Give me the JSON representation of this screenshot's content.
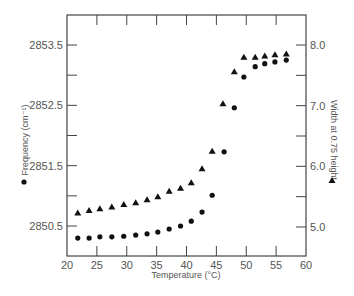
{
  "chart_data": {
    "type": "scatter",
    "title": "",
    "xlabel": "Temperature (°C)",
    "ylabel": "Frequency (cm⁻¹)",
    "y2label": "Width at 0.75 height",
    "xlim": [
      20,
      60
    ],
    "ylim": [
      2850.2,
      2854.0
    ],
    "y2lim": [
      4.7,
      8.5
    ],
    "x_ticks": [
      20,
      25,
      30,
      35,
      40,
      45,
      50,
      55,
      60
    ],
    "y_ticks": [
      2850.5,
      2851.5,
      2852.5,
      2853.5
    ],
    "y_ticks_labels": [
      "2850.5",
      "2851.5",
      "2852.5",
      "2853.5"
    ],
    "y2_ticks": [
      5.0,
      6.0,
      7.0,
      8.0
    ],
    "y2_ticks_labels": [
      "5.0",
      "6.0",
      "7.0",
      "8.0"
    ],
    "grid": false,
    "legend": [
      {
        "marker": "circle",
        "label": "Frequency (cm⁻¹)",
        "axis": "left"
      },
      {
        "marker": "triangle",
        "label": "Width at 0.75 height",
        "axis": "right"
      }
    ],
    "series": [
      {
        "name": "Frequency",
        "marker": "circle",
        "axis": "left",
        "x": [
          21.8,
          23.7,
          25.5,
          27.5,
          29.5,
          31.5,
          33.4,
          35.2,
          37.1,
          39.0,
          40.8,
          42.6,
          44.3,
          46.3,
          48.0,
          49.6,
          51.5,
          53.1,
          54.8,
          56.7
        ],
        "values": [
          2850.3,
          2850.3,
          2850.32,
          2850.32,
          2850.33,
          2850.35,
          2850.37,
          2850.4,
          2850.45,
          2850.5,
          2850.58,
          2850.73,
          2851.01,
          2851.73,
          2852.46,
          2852.97,
          2853.14,
          2853.19,
          2853.22,
          2853.25
        ]
      },
      {
        "name": "Width at 0.75 height",
        "marker": "triangle",
        "axis": "right",
        "x": [
          21.8,
          23.7,
          25.5,
          27.5,
          29.5,
          31.5,
          33.4,
          35.2,
          37.1,
          39.0,
          40.8,
          42.6,
          44.3,
          46.1,
          48.0,
          49.6,
          51.5,
          53.1,
          54.8,
          56.7
        ],
        "values": [
          5.23,
          5.27,
          5.3,
          5.33,
          5.37,
          5.4,
          5.45,
          5.5,
          5.59,
          5.64,
          5.73,
          5.96,
          6.25,
          7.03,
          7.56,
          7.8,
          7.8,
          7.82,
          7.84,
          7.85
        ]
      }
    ]
  }
}
